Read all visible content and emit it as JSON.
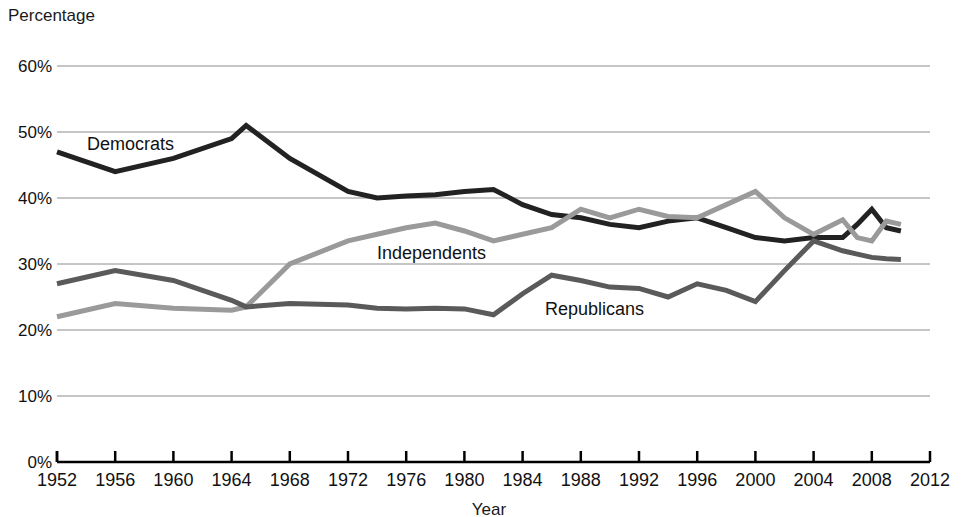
{
  "chart_data": {
    "type": "line",
    "title": "",
    "xlabel": "Year",
    "ylabel": "Percentage",
    "xlim": [
      1952,
      2012
    ],
    "ylim": [
      0,
      60
    ],
    "grid": true,
    "legend_position": "inline-annotations",
    "x_ticks": [
      "1952",
      "1956",
      "1960",
      "1964",
      "1968",
      "1972",
      "1976",
      "1980",
      "1984",
      "1988",
      "1992",
      "1996",
      "2000",
      "2004",
      "2008",
      "2012"
    ],
    "y_ticks": [
      "0%",
      "10%",
      "20%",
      "30%",
      "40%",
      "50%",
      "60%"
    ],
    "x": [
      1952,
      1956,
      1960,
      1964,
      1965,
      1968,
      1972,
      1974,
      1976,
      1978,
      1980,
      1982,
      1984,
      1986,
      1988,
      1990,
      1992,
      1994,
      1996,
      1998,
      2000,
      2002,
      2004,
      2006,
      2007,
      2008,
      2009,
      2010
    ],
    "series": [
      {
        "name": "Democrats",
        "color": "#222222",
        "values": [
          47.0,
          44.0,
          46.0,
          49.0,
          51.0,
          46.0,
          41.0,
          40.0,
          40.3,
          40.5,
          41.0,
          41.3,
          39.0,
          37.5,
          37.0,
          36.0,
          35.5,
          36.5,
          37.0,
          35.5,
          34.0,
          33.5,
          34.0,
          34.0,
          36.0,
          38.3,
          35.5,
          35.0
        ],
        "label_position": {
          "x": 85,
          "y": 134
        }
      },
      {
        "name": "Independents",
        "color": "#9a9a9a",
        "values": [
          22.0,
          24.0,
          23.3,
          23.0,
          23.5,
          30.0,
          33.5,
          34.5,
          35.5,
          36.2,
          35.0,
          33.5,
          34.5,
          35.5,
          38.3,
          37.0,
          38.3,
          37.2,
          37.0,
          39.0,
          41.0,
          37.0,
          34.5,
          36.7,
          34.0,
          33.5,
          36.5,
          36.0
        ],
        "label_position": {
          "x": 375,
          "y": 243
        }
      },
      {
        "name": "Republicans",
        "color": "#5a5a5a",
        "values": [
          27.0,
          29.0,
          27.5,
          24.5,
          23.5,
          24.0,
          23.8,
          23.3,
          23.2,
          23.3,
          23.2,
          22.3,
          25.5,
          28.3,
          27.5,
          26.5,
          26.3,
          25.0,
          27.0,
          26.0,
          24.3,
          29.0,
          33.5,
          32.0,
          31.5,
          31.0,
          30.8,
          30.7
        ],
        "label_position": {
          "x": 543,
          "y": 299
        }
      }
    ]
  },
  "axis": {
    "y_title": "Percentage",
    "x_title": "Year"
  }
}
